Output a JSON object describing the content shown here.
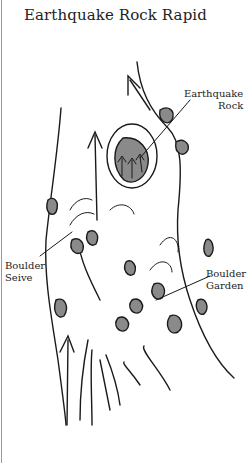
{
  "title": "Earthquake Rock Rapid",
  "labels": {
    "earthquake_rock": [
      "Earthquake",
      "Rock"
    ],
    "boulder_seive": [
      "Boulder",
      "Seive"
    ],
    "boulder_garden": [
      "Boulder",
      "Garden"
    ]
  },
  "colors": {
    "rock_fill": "#8a8a8a",
    "stroke": "#1a1a1a"
  }
}
